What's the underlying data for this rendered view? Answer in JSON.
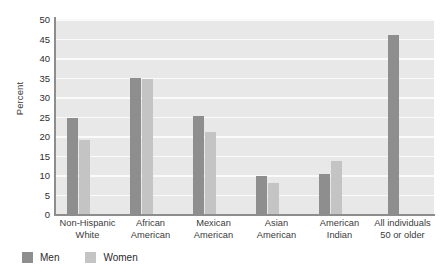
{
  "chart_data": {
    "type": "bar",
    "title": "",
    "subtitle": "",
    "xlabel": "",
    "ylabel": "Percent",
    "ylim": [
      0,
      50
    ],
    "ytick_step": 5,
    "yticks": [
      "50",
      "45",
      "40",
      "35",
      "30",
      "25",
      "20",
      "15",
      "10",
      "5",
      "0"
    ],
    "grid": true,
    "legend_position": "bottom-left",
    "categories": [
      "Non-Hispanic\nWhite",
      "African\nAmerican",
      "Mexican\nAmerican",
      "Asian\nAmerican",
      "American\nIndian",
      "All individuals\n50 or older"
    ],
    "series": [
      {
        "name": "Men",
        "color": "#8e8e8e",
        "values": [
          24.5,
          35.0,
          25.2,
          9.7,
          10.3,
          45.8
        ]
      },
      {
        "name": "Women",
        "color": "#c4c4c4",
        "values": [
          19.0,
          34.5,
          21.0,
          8.0,
          13.6,
          null
        ]
      }
    ]
  },
  "legend": {
    "items": [
      {
        "label": "Men",
        "color": "#8e8e8e"
      },
      {
        "label": "Women",
        "color": "#c4c4c4"
      }
    ]
  },
  "colors": {
    "plot_background": "#e8e8e8",
    "gridline": "#fafafa",
    "axis": "#8d8d8d",
    "men": "#8e8e8e",
    "women": "#c4c4c4",
    "text": "#333333"
  }
}
